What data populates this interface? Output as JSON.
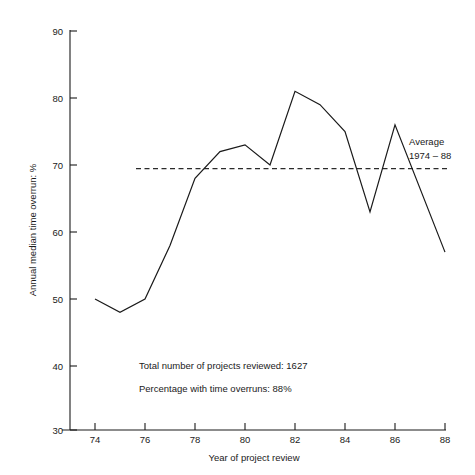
{
  "chart_data": {
    "type": "line",
    "title": "",
    "xlabel": "Year of project review",
    "ylabel": "Annual median time overrun: %",
    "xlim": [
      73.2,
      88.6
    ],
    "ylim": [
      30,
      90
    ],
    "xticks": [
      74,
      76,
      78,
      80,
      82,
      84,
      86,
      88
    ],
    "xtick_labels": [
      "74",
      "76",
      "78",
      "80",
      "82",
      "84",
      "86",
      "88"
    ],
    "yticks": [
      30,
      40,
      50,
      60,
      70,
      80,
      90
    ],
    "ytick_labels": [
      "30",
      "40",
      "50",
      "60",
      "70",
      "80",
      "90"
    ],
    "grid": false,
    "legend": "none",
    "x": [
      74,
      75,
      76,
      77,
      78,
      79,
      80,
      81,
      82,
      83,
      84,
      85,
      86,
      88
    ],
    "series": [
      {
        "name": "Annual median time overrun",
        "values": [
          50,
          48,
          50,
          58,
          68,
          72,
          73,
          70,
          81,
          79,
          75,
          63,
          76,
          57
        ]
      }
    ],
    "reference_line": {
      "name": "Average 1974 - 88",
      "value": 69,
      "style": "dashed",
      "label_line1": "Average",
      "label_line2": "1974 – 88"
    },
    "annotations": [
      "Total number of projects reviewed: 1627",
      "Percentage with time overruns: 88%"
    ]
  },
  "notes": {
    "line1": "Total number of projects reviewed: 1627",
    "line2": "Percentage with time overruns: 88%"
  },
  "average_label": {
    "line1": "Average",
    "line2": "1974 – 88"
  },
  "axis": {
    "x_title": "Year of project review",
    "y_title": "Annual median time overrun: %"
  },
  "ytick_labels": {
    "t90": "90",
    "t80": "80",
    "t70": "70",
    "t60": "60",
    "t50": "50",
    "t40": "40",
    "t30": "30"
  },
  "xtick_labels": {
    "t74": "74",
    "t76": "76",
    "t78": "78",
    "t80": "80",
    "t82": "82",
    "t84": "84",
    "t86": "86",
    "t88": "88"
  },
  "colors": {
    "line": "#1a1a1a",
    "average": "#2b2b2b",
    "background": "#ffffff"
  }
}
